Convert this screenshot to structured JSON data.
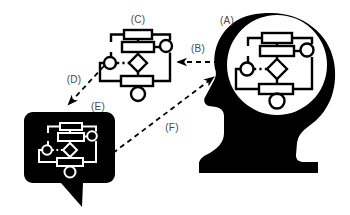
{
  "figure": {
    "background_color": "#ffffff",
    "ink_color": "#000000",
    "label_color": "#4a4a4a",
    "width": 350,
    "height": 215
  },
  "labels": {
    "a": "(A)",
    "b": "(B)",
    "c": "(C)",
    "d": "(D)",
    "e": "(E)",
    "f": "(F)"
  },
  "nodes": {
    "head": {
      "name": "head-silhouette",
      "label": "(A)",
      "fill": "#000000",
      "brain_fill": "#ffffff",
      "diagram_stroke": "#000000"
    },
    "flowchart": {
      "name": "standalone-flowchart",
      "label": "(C)",
      "stroke": "#000000",
      "fill": "#ffffff"
    },
    "bubble": {
      "name": "speech-bubble",
      "label": "(E)",
      "fill": "#000000",
      "diagram_stroke": "#ffffff"
    }
  },
  "arrows": [
    {
      "name": "arrow-b",
      "label": "(B)",
      "from": "head-silhouette",
      "to": "standalone-flowchart",
      "direction": "left",
      "style": "dashed"
    },
    {
      "name": "arrow-d",
      "label": "(D)",
      "from": "standalone-flowchart",
      "to": "speech-bubble",
      "direction": "down-left",
      "style": "dashed"
    },
    {
      "name": "arrow-f",
      "label": "(F)",
      "from": "speech-bubble",
      "to": "head-silhouette",
      "direction": "up-right",
      "style": "dashed"
    }
  ]
}
